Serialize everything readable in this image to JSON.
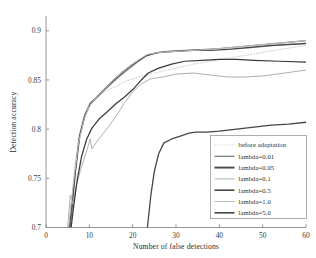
{
  "chart_data": {
    "type": "line",
    "title": "",
    "xlabel": "Number of false detections",
    "ylabel": "Detection accuracy",
    "xlim": [
      0,
      60
    ],
    "ylim": [
      0.7,
      0.915
    ],
    "xticks": [
      0,
      10,
      20,
      30,
      40,
      50,
      60
    ],
    "xticklabels": [
      "0",
      "10",
      "20",
      "30",
      "40",
      "50",
      "60"
    ],
    "yticks": [
      0.7,
      0.75,
      0.8,
      0.85,
      0.9
    ],
    "yticklabels": [
      "0.7",
      "0.75",
      "0.8",
      "0.85",
      "0.9"
    ],
    "grid": false,
    "legend_position": "lower right",
    "series": [
      {
        "name": "before adaptation",
        "color": "#c8c8c8",
        "style": "dotted",
        "width": 0.9,
        "points": [
          [
            5.2,
            0.7
          ],
          [
            6.0,
            0.731
          ],
          [
            6.6,
            0.76
          ],
          [
            7.4,
            0.79
          ],
          [
            8.6,
            0.812
          ],
          [
            10.0,
            0.826
          ],
          [
            12.0,
            0.833
          ],
          [
            14.0,
            0.839
          ],
          [
            16.0,
            0.843
          ],
          [
            18.0,
            0.848
          ],
          [
            20.0,
            0.851
          ],
          [
            22.0,
            0.854
          ],
          [
            24.0,
            0.856
          ],
          [
            27.0,
            0.859
          ],
          [
            30.0,
            0.862
          ],
          [
            34.0,
            0.866
          ],
          [
            38.0,
            0.869
          ],
          [
            42.0,
            0.872
          ],
          [
            46.0,
            0.875
          ],
          [
            50.0,
            0.878
          ],
          [
            54.0,
            0.881
          ],
          [
            60.0,
            0.885
          ]
        ]
      },
      {
        "name": "lambda=0.01",
        "color": "#6e6e6e",
        "style": "solid",
        "width": 1.15,
        "points": [
          [
            5.6,
            0.7
          ],
          [
            6.2,
            0.726
          ],
          [
            6.8,
            0.757
          ],
          [
            7.6,
            0.79
          ],
          [
            8.8,
            0.812
          ],
          [
            10.2,
            0.825
          ],
          [
            11.4,
            0.831
          ],
          [
            13.0,
            0.838
          ],
          [
            15.0,
            0.846
          ],
          [
            17.0,
            0.854
          ],
          [
            19.0,
            0.861
          ],
          [
            21.0,
            0.868
          ],
          [
            23.0,
            0.874
          ],
          [
            25.0,
            0.877
          ],
          [
            28.0,
            0.879
          ],
          [
            32.0,
            0.88
          ],
          [
            36.0,
            0.881
          ],
          [
            40.0,
            0.882
          ],
          [
            45.0,
            0.884
          ],
          [
            50.0,
            0.886
          ],
          [
            55.0,
            0.888
          ],
          [
            60.0,
            0.89
          ]
        ]
      },
      {
        "name": "lambda=0.05",
        "color": "#4a4a4a",
        "style": "solid",
        "width": 1.35,
        "points": [
          [
            5.4,
            0.7
          ],
          [
            6.1,
            0.73
          ],
          [
            6.9,
            0.762
          ],
          [
            7.8,
            0.793
          ],
          [
            9.0,
            0.814
          ],
          [
            10.2,
            0.826
          ],
          [
            11.6,
            0.832
          ],
          [
            13.4,
            0.84
          ],
          [
            15.4,
            0.849
          ],
          [
            17.4,
            0.857
          ],
          [
            19.4,
            0.864
          ],
          [
            21.4,
            0.87
          ],
          [
            23.2,
            0.875
          ],
          [
            26.0,
            0.878
          ],
          [
            30.0,
            0.879
          ],
          [
            34.0,
            0.88
          ],
          [
            38.0,
            0.88
          ],
          [
            42.0,
            0.881
          ],
          [
            47.0,
            0.883
          ],
          [
            52.0,
            0.885
          ],
          [
            56.0,
            0.886
          ],
          [
            60.0,
            0.887
          ]
        ]
      },
      {
        "name": "lambda=0.1",
        "color": "#b0b0b0",
        "style": "solid",
        "width": 1.0,
        "points": [
          [
            5.0,
            0.7
          ],
          [
            5.6,
            0.733
          ],
          [
            6.2,
            0.724
          ],
          [
            7.0,
            0.743
          ],
          [
            8.2,
            0.762
          ],
          [
            9.4,
            0.778
          ],
          [
            10.2,
            0.79
          ],
          [
            10.6,
            0.78
          ],
          [
            12.0,
            0.789
          ],
          [
            14.0,
            0.8
          ],
          [
            16.0,
            0.812
          ],
          [
            18.0,
            0.826
          ],
          [
            20.0,
            0.838
          ],
          [
            22.0,
            0.846
          ],
          [
            24.0,
            0.851
          ],
          [
            27.0,
            0.853
          ],
          [
            30.0,
            0.856
          ],
          [
            34.0,
            0.857
          ],
          [
            38.0,
            0.855
          ],
          [
            42.0,
            0.853
          ],
          [
            46.0,
            0.853
          ],
          [
            50.0,
            0.854
          ],
          [
            55.0,
            0.857
          ],
          [
            60.0,
            0.86
          ]
        ]
      },
      {
        "name": "lambda=0.5",
        "color": "#3a3a3a",
        "style": "solid",
        "width": 1.25,
        "points": [
          [
            5.8,
            0.7
          ],
          [
            6.4,
            0.722
          ],
          [
            7.2,
            0.748
          ],
          [
            8.2,
            0.772
          ],
          [
            9.4,
            0.79
          ],
          [
            10.6,
            0.801
          ],
          [
            12.2,
            0.81
          ],
          [
            14.2,
            0.818
          ],
          [
            16.2,
            0.826
          ],
          [
            18.2,
            0.833
          ],
          [
            20.2,
            0.841
          ],
          [
            22.0,
            0.85
          ],
          [
            23.6,
            0.857
          ],
          [
            26.0,
            0.862
          ],
          [
            29.0,
            0.866
          ],
          [
            32.0,
            0.869
          ],
          [
            36.0,
            0.87
          ],
          [
            40.0,
            0.871
          ],
          [
            44.0,
            0.871
          ],
          [
            48.0,
            0.87
          ],
          [
            54.0,
            0.869
          ],
          [
            60.0,
            0.868
          ]
        ]
      },
      {
        "name": "lambda=1.0",
        "color": "#c0c0c0",
        "style": "solid",
        "width": 1.0,
        "points": [
          [
            5.2,
            0.7
          ],
          [
            5.9,
            0.728
          ],
          [
            6.6,
            0.755
          ],
          [
            7.5,
            0.786
          ],
          [
            8.8,
            0.81
          ],
          [
            10.0,
            0.824
          ],
          [
            11.8,
            0.833
          ],
          [
            13.6,
            0.841
          ],
          [
            15.6,
            0.85
          ],
          [
            17.6,
            0.858
          ],
          [
            19.6,
            0.865
          ],
          [
            21.6,
            0.871
          ],
          [
            23.4,
            0.876
          ],
          [
            26.0,
            0.878
          ],
          [
            30.0,
            0.879
          ],
          [
            34.0,
            0.88
          ],
          [
            38.0,
            0.881
          ],
          [
            43.0,
            0.883
          ],
          [
            48.0,
            0.885
          ],
          [
            53.0,
            0.887
          ],
          [
            60.0,
            0.89
          ]
        ]
      },
      {
        "name": "lambda=5.0",
        "color": "#454545",
        "style": "solid",
        "width": 1.3,
        "points": [
          [
            23.4,
            0.7
          ],
          [
            24.2,
            0.733
          ],
          [
            25.0,
            0.757
          ],
          [
            26.0,
            0.775
          ],
          [
            27.2,
            0.786
          ],
          [
            29.0,
            0.79
          ],
          [
            31.0,
            0.793
          ],
          [
            33.0,
            0.796
          ],
          [
            34.5,
            0.797
          ],
          [
            37.0,
            0.797
          ],
          [
            40.0,
            0.798
          ],
          [
            44.0,
            0.8
          ],
          [
            48.0,
            0.802
          ],
          [
            52.0,
            0.804
          ],
          [
            56.0,
            0.805
          ],
          [
            60.0,
            0.807
          ]
        ]
      }
    ],
    "legend_entries": [
      {
        "label": "before adaptation",
        "color": "#c8c8c8",
        "style": "dotted",
        "width": 0.9
      },
      {
        "label": "lambda=0.01",
        "color": "#6e6e6e",
        "style": "solid",
        "width": 1.15
      },
      {
        "label": "lambda=0.05",
        "color": "#4a4a4a",
        "style": "solid",
        "width": 1.9
      },
      {
        "label": "lambda=0.1",
        "color": "#b0b0b0",
        "style": "solid",
        "width": 1.0
      },
      {
        "label": "lambda=0.5",
        "color": "#3a3a3a",
        "style": "solid",
        "width": 1.5
      },
      {
        "label": "lambda=1.0",
        "color": "#c0c0c0",
        "style": "solid",
        "width": 1.0
      },
      {
        "label": "lambda=5.0",
        "color": "#454545",
        "style": "solid",
        "width": 1.6
      }
    ]
  }
}
